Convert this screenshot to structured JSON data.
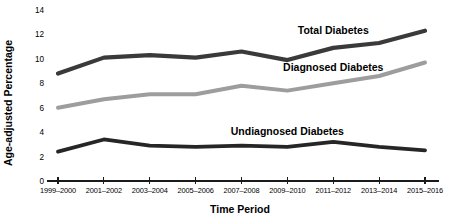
{
  "chart_data": {
    "type": "line",
    "title": "",
    "xlabel": "Time Period",
    "ylabel": "Age-adjusted Percentage",
    "categories": [
      "1999–2000",
      "2001–2002",
      "2003–2004",
      "2005–2006",
      "2007–2008",
      "2009–2010",
      "2011–2012",
      "2013–2014",
      "2015–2016"
    ],
    "ylim": [
      0,
      14
    ],
    "yticks": [
      0,
      2,
      4,
      6,
      8,
      10,
      12,
      14
    ],
    "grid": false,
    "legend_position": "inline-labels",
    "series": [
      {
        "name": "Total Diabetes",
        "color": "#3a3a3a",
        "values": [
          8.8,
          10.1,
          10.3,
          10.1,
          10.6,
          9.9,
          10.9,
          11.3,
          12.3
        ],
        "label_x_index": 6,
        "label_text": "Total Diabetes"
      },
      {
        "name": "Diagnosed Diabetes",
        "color": "#9d9d9d",
        "values": [
          6.0,
          6.7,
          7.1,
          7.1,
          7.8,
          7.4,
          8.0,
          8.6,
          9.7
        ],
        "label_x_index": 6,
        "label_text": "Diagnosed Diabetes"
      },
      {
        "name": "Undiagnosed Diabetes",
        "color": "#262626",
        "values": [
          2.4,
          3.4,
          2.9,
          2.8,
          2.9,
          2.8,
          3.2,
          2.8,
          2.5
        ],
        "label_x_index": 5,
        "label_text": "Undiagnosed Diabetes"
      }
    ]
  },
  "axis": {
    "y_title": "Age-adjusted Percentage",
    "x_title": "Time Period"
  },
  "labels": {
    "total": "Total Diabetes",
    "diagnosed": "Diagnosed Diabetes",
    "undiagnosed": "Undiagnosed Diabetes"
  }
}
